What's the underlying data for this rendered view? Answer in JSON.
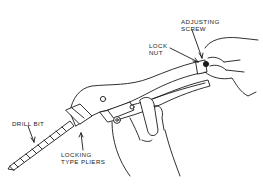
{
  "figure": {
    "labels": {
      "adjusting_screw_line1": "ADJUSTING",
      "adjusting_screw_line2": "SCREW",
      "lock_nut_line1": "LOCK",
      "lock_nut_line2": "NUT",
      "drill_bit": "DRILL BIT",
      "pliers_line1": "LOCKING",
      "pliers_line2": "TYPE PLIERS"
    },
    "colors": {
      "line": "#1a1a1a",
      "background": "#ffffff"
    }
  }
}
